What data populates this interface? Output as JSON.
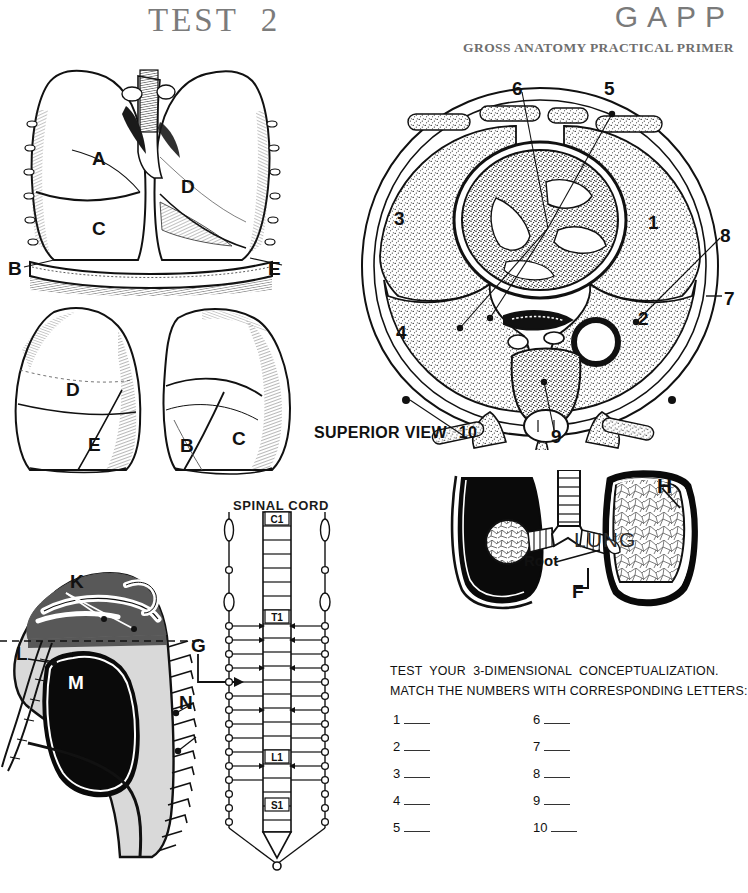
{
  "header": {
    "test_title": "TEST  2",
    "brand": "GAPP",
    "brand_subtitle": "GROSS ANATOMY PRACTICAL PRIMER"
  },
  "figures": {
    "anterior_lungs": {
      "name": "anterior-lungs-illustration",
      "labels": [
        {
          "text": "A",
          "x": 92,
          "y": 157
        },
        {
          "text": "C",
          "x": 92,
          "y": 227
        },
        {
          "text": "D",
          "x": 182,
          "y": 185
        },
        {
          "text": "B",
          "x": 10,
          "y": 267
        },
        {
          "text": "E",
          "x": 269,
          "y": 266
        }
      ]
    },
    "inferior_lungs": {
      "name": "isolated-lungs-illustration",
      "labels": [
        {
          "text": "D",
          "x": 68,
          "y": 388
        },
        {
          "text": "E",
          "x": 90,
          "y": 443
        },
        {
          "text": "B",
          "x": 182,
          "y": 444
        },
        {
          "text": "C",
          "x": 233,
          "y": 437
        }
      ]
    },
    "cross_section": {
      "name": "thorax-cross-section",
      "caption": "SUPERIOR VIEW",
      "caption_number": "10",
      "numbers": [
        {
          "text": "6",
          "x": 516,
          "y": 79
        },
        {
          "text": "5",
          "x": 608,
          "y": 79
        },
        {
          "text": "3",
          "x": 397,
          "y": 211
        },
        {
          "text": "1",
          "x": 650,
          "y": 215
        },
        {
          "text": "8",
          "x": 722,
          "y": 228
        },
        {
          "text": "7",
          "x": 726,
          "y": 291
        },
        {
          "text": "4",
          "x": 399,
          "y": 325
        },
        {
          "text": "2",
          "x": 641,
          "y": 311
        },
        {
          "text": "9",
          "x": 553,
          "y": 430
        }
      ]
    },
    "bronchial_lung": {
      "name": "lung-root-illustration",
      "labels": [
        {
          "text": "H",
          "x": 663,
          "y": 481
        },
        {
          "text": "LUNG",
          "x": 601,
          "y": 537
        },
        {
          "text": "Root",
          "x": 551,
          "y": 560
        },
        {
          "text": "F",
          "x": 576,
          "y": 590
        }
      ]
    },
    "lateral_thorax": {
      "name": "lateral-thorax-illustration",
      "labels": [
        {
          "text": "K",
          "x": 72,
          "y": 580
        },
        {
          "text": "L",
          "x": 19,
          "y": 652
        },
        {
          "text": "M",
          "x": 71,
          "y": 680
        },
        {
          "text": "N",
          "x": 181,
          "y": 700
        },
        {
          "text": "G",
          "x": 193,
          "y": 643
        }
      ]
    },
    "spinal_cord": {
      "name": "spinal-cord-diagram",
      "title": "SPINAL CORD",
      "segments": [
        "C1",
        "T1",
        "L1",
        "S1"
      ]
    }
  },
  "instructions": {
    "line1": "TEST  YOUR  3-DIMENSIONAL  CONCEPTUALIZATION.",
    "line2": "MATCH THE NUMBERS WITH CORRESPONDING LETTERS:"
  },
  "answers": {
    "left_column": [
      "1",
      "2",
      "3",
      "4",
      "5"
    ],
    "right_column": [
      "6",
      "7",
      "8",
      "9",
      "10"
    ]
  },
  "colors": {
    "ink": "#111111",
    "header_gray": "#7a7a7a",
    "lung_fill": "#000000",
    "soft_gray": "#d9d9d9",
    "mid_gray": "#585858"
  }
}
